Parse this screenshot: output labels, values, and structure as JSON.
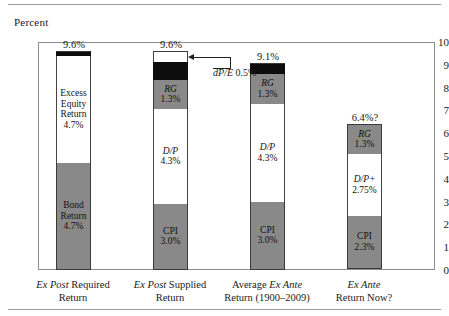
{
  "axis_title": "Percent",
  "chart_data": {
    "type": "bar",
    "title": "",
    "xlabel": "",
    "ylabel": "Percent",
    "ylim": [
      0,
      10
    ],
    "yticks": [
      "0",
      "1",
      "2",
      "3",
      "4",
      "5",
      "6",
      "7",
      "8",
      "9",
      "10"
    ],
    "grid": false,
    "legend": "none",
    "stacked": true,
    "categories": [
      "Ex Post Required Return",
      "Ex Post Supplied Return",
      "Average Ex Ante Return (1900-2009)",
      "Ex Ante Return Now?"
    ],
    "totals": [
      "9.6%",
      "9.6%",
      "9.1%",
      "6.4%?"
    ],
    "total_values": [
      9.6,
      9.6,
      9.1,
      6.4
    ],
    "bars": [
      {
        "category": "Ex Post Required Return",
        "total_label": "9.6%",
        "segments": [
          {
            "label": "",
            "value_label": "",
            "value": 0.2,
            "fill": "black"
          },
          {
            "label": "Excess Equity Return",
            "value_label": "4.7%",
            "value": 4.7,
            "fill": "white"
          },
          {
            "label": "Bond Return",
            "value_label": "4.7%",
            "value": 4.7,
            "fill": "gray"
          }
        ]
      },
      {
        "category": "Ex Post Supplied Return",
        "total_label": "9.6%",
        "segments": [
          {
            "label": "dP/E",
            "value_label": "0.5%",
            "value": 0.5,
            "fill": "white"
          },
          {
            "label": "",
            "value_label": "",
            "value": 0.8,
            "fill": "black"
          },
          {
            "label": "RG",
            "value_label": "1.3%",
            "value": 1.3,
            "fill": "gray"
          },
          {
            "label": "D/P",
            "value_label": "4.3%",
            "value": 4.3,
            "fill": "white"
          },
          {
            "label": "CPI",
            "value_label": "3.0%",
            "value": 3.0,
            "fill": "gray"
          }
        ]
      },
      {
        "category": "Average Ex Ante Return (1900-2009)",
        "total_label": "9.1%",
        "segments": [
          {
            "label": "",
            "value_label": "",
            "value": 0.5,
            "fill": "black"
          },
          {
            "label": "RG",
            "value_label": "1.3%",
            "value": 1.3,
            "fill": "gray"
          },
          {
            "label": "D/P",
            "value_label": "4.3%",
            "value": 4.3,
            "fill": "white"
          },
          {
            "label": "CPI",
            "value_label": "3.0%",
            "value": 3.0,
            "fill": "gray"
          }
        ]
      },
      {
        "category": "Ex Ante Return Now?",
        "total_label": "6.4%?",
        "segments": [
          {
            "label": "RG",
            "value_label": "1.3%",
            "value": 1.3,
            "fill": "gray"
          },
          {
            "label": "D/P+",
            "value_label": "2.75%",
            "value": 2.75,
            "fill": "white"
          },
          {
            "label": "CPI",
            "value_label": "2.3%",
            "value": 2.3,
            "fill": "gray"
          }
        ]
      }
    ],
    "annotations": [
      {
        "name": "dpe-callout",
        "text_italic": "dP/E",
        "text_rest": " 0.5%",
        "points_to": "Ex Post Supplied Return top segment"
      }
    ]
  },
  "xaxis": {
    "labels": [
      {
        "line1_it": "Ex Post",
        "line1_rest": " Required",
        "line2": "Return"
      },
      {
        "line1_it": "Ex Post",
        "line1_rest": " Supplied",
        "line2": "Return"
      },
      {
        "line1_pre": "Average ",
        "line1_it": "Ex Ante",
        "line1_rest": "",
        "line2": "Return (1900–2009)"
      },
      {
        "line1_it": "Ex Ante",
        "line1_rest": "",
        "line2": "Return Now?"
      }
    ]
  },
  "colors": {
    "gray_fill": "#898989",
    "black_fill": "#0d0d0d",
    "white_fill": "#ffffff",
    "frame": "#8d8d8d",
    "rule": "#9a9a9a"
  }
}
